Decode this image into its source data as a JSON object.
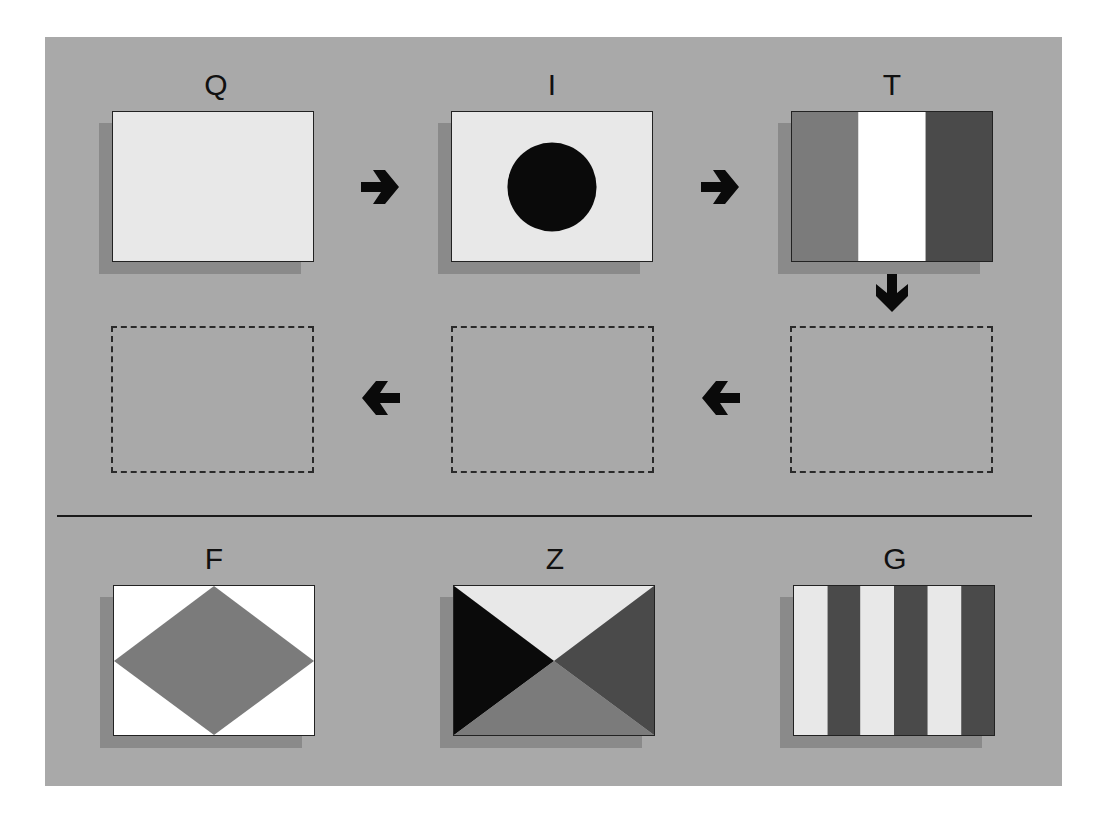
{
  "colors": {
    "panel_background": "#a9a9a9",
    "flag_light": "#e8e8e8",
    "flag_white": "#ffffff",
    "flag_black": "#0a0a0a",
    "flag_medium_gray": "#7b7b7b",
    "flag_dark_gray": "#4a4a4a",
    "border": "#222222"
  },
  "sequence": {
    "row1": [
      {
        "letter": "Q",
        "pattern": "solid-light"
      },
      {
        "letter": "I",
        "pattern": "light-with-black-circle"
      },
      {
        "letter": "T",
        "pattern": "vertical-tricolor-medium-white-dark"
      }
    ],
    "row2_slots": [
      {
        "slot": 1,
        "state": "empty"
      },
      {
        "slot": 2,
        "state": "empty"
      },
      {
        "slot": 3,
        "state": "empty"
      }
    ],
    "arrows": [
      {
        "direction": "right",
        "icon": "arrow-right-icon"
      },
      {
        "direction": "right",
        "icon": "arrow-right-icon"
      },
      {
        "direction": "down",
        "icon": "arrow-down-icon"
      },
      {
        "direction": "left",
        "icon": "arrow-left-icon"
      },
      {
        "direction": "left",
        "icon": "arrow-left-icon"
      }
    ]
  },
  "options": [
    {
      "letter": "F",
      "pattern": "white-with-medium-gray-diamond"
    },
    {
      "letter": "Z",
      "pattern": "four-triangles-light-top-black-left-dark-right-medium-bottom"
    },
    {
      "letter": "G",
      "pattern": "six-vertical-stripes-light-dark-alternating"
    }
  ]
}
